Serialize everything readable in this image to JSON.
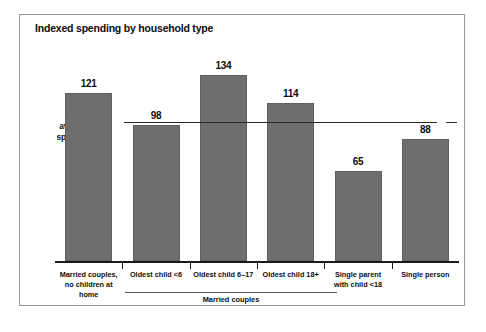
{
  "chart_data": {
    "type": "bar",
    "title": "Indexed spending by household type",
    "xlabel": "",
    "ylabel": "",
    "reference_line": {
      "value": 100,
      "label_line1": "100 =",
      "label_line2": "average",
      "label_line3": "spending"
    },
    "categories": [
      "Married couples,\nno children at home",
      "Oldest child <6",
      "Oldest child 6–17",
      "Oldest child 18+",
      "Single parent\nwith child <18",
      "Single person"
    ],
    "bars": [
      {
        "label_line1": "Married couples,",
        "label_line2": "no children at home",
        "value": 121,
        "value_text": "121"
      },
      {
        "label_line1": "Oldest child <6",
        "label_line2": "",
        "value": 98,
        "value_text": "98"
      },
      {
        "label_line1": "Oldest child 6–17",
        "label_line2": "",
        "value": 134,
        "value_text": "134"
      },
      {
        "label_line1": "Oldest child 18+",
        "label_line2": "",
        "value": 114,
        "value_text": "114"
      },
      {
        "label_line1": "Single parent",
        "label_line2": "with child <18",
        "value": 65,
        "value_text": "65"
      },
      {
        "label_line1": "Single person",
        "label_line2": "",
        "value": 88,
        "value_text": "88"
      }
    ],
    "values": [
      121,
      98,
      134,
      114,
      65,
      88
    ],
    "group_bracket": {
      "label": "Married couples",
      "covers": [
        "Oldest child <6",
        "Oldest child 6–17",
        "Oldest child 18+"
      ]
    },
    "ylim": [
      0,
      145
    ],
    "grid": false,
    "legend": false,
    "bar_color": "#6e6e6e",
    "axis_color": "#1a1a1a",
    "background": "#ffffff"
  }
}
